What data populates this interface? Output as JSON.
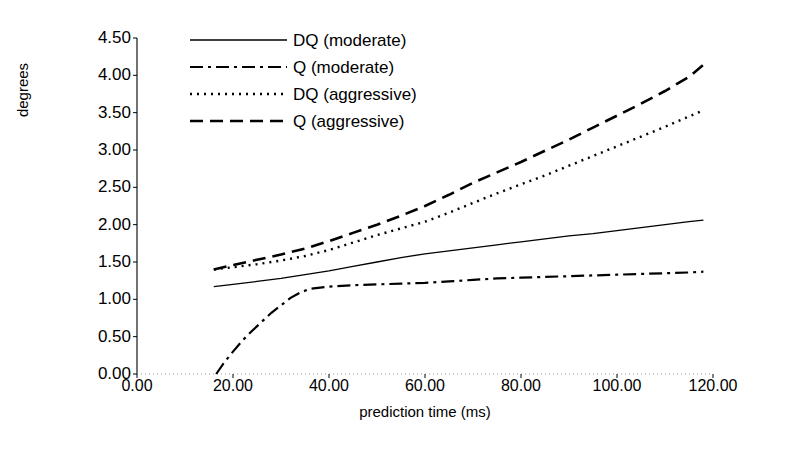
{
  "chart_data": {
    "type": "line",
    "title": "",
    "xlabel": "prediction time (ms)",
    "ylabel": "degrees",
    "xlim": [
      0,
      120
    ],
    "ylim": [
      0,
      4.5
    ],
    "xticks": [
      "0.00",
      "20.00",
      "40.00",
      "60.00",
      "80.00",
      "100.00",
      "120.00"
    ],
    "xtick_values": [
      0,
      20,
      40,
      60,
      80,
      100,
      120
    ],
    "yticks": [
      "0.00",
      "0.50",
      "1.00",
      "1.50",
      "2.00",
      "2.50",
      "3.00",
      "3.50",
      "4.00",
      "4.50"
    ],
    "ytick_values": [
      0,
      0.5,
      1,
      1.5,
      2,
      2.5,
      3,
      3.5,
      4,
      4.5
    ],
    "grid": false,
    "legend_position": "top-center",
    "series": [
      {
        "name": "DQ (moderate)",
        "style": "solid",
        "x": [
          16,
          20,
          25,
          30,
          35,
          40,
          45,
          50,
          55,
          60,
          65,
          70,
          75,
          80,
          85,
          90,
          95,
          100,
          105,
          110,
          115,
          118
        ],
        "y": [
          1.17,
          1.2,
          1.24,
          1.28,
          1.33,
          1.38,
          1.44,
          1.5,
          1.56,
          1.61,
          1.65,
          1.69,
          1.73,
          1.77,
          1.81,
          1.85,
          1.88,
          1.92,
          1.96,
          2.0,
          2.04,
          2.06
        ]
      },
      {
        "name": "Q (moderate)",
        "style": "dashdot",
        "x": [
          16.5,
          18,
          20,
          22,
          24,
          26,
          28,
          30,
          32,
          34,
          36,
          40,
          45,
          50,
          55,
          60,
          65,
          70,
          75,
          80,
          85,
          90,
          95,
          100,
          105,
          110,
          115,
          118
        ],
        "y": [
          0.0,
          0.14,
          0.3,
          0.45,
          0.58,
          0.7,
          0.82,
          0.92,
          1.02,
          1.09,
          1.14,
          1.17,
          1.19,
          1.2,
          1.21,
          1.22,
          1.24,
          1.26,
          1.28,
          1.29,
          1.3,
          1.31,
          1.32,
          1.33,
          1.34,
          1.35,
          1.36,
          1.37
        ]
      },
      {
        "name": "DQ (aggressive)",
        "style": "dotted",
        "x": [
          16,
          20,
          25,
          30,
          35,
          40,
          45,
          50,
          55,
          60,
          65,
          70,
          75,
          80,
          85,
          90,
          95,
          100,
          105,
          110,
          115,
          118
        ],
        "y": [
          1.4,
          1.43,
          1.47,
          1.52,
          1.58,
          1.66,
          1.76,
          1.86,
          1.95,
          2.04,
          2.16,
          2.29,
          2.42,
          2.54,
          2.66,
          2.79,
          2.92,
          3.05,
          3.18,
          3.31,
          3.45,
          3.53
        ]
      },
      {
        "name": "Q (aggressive)",
        "style": "dashed",
        "x": [
          16,
          20,
          25,
          30,
          35,
          40,
          45,
          50,
          55,
          60,
          65,
          70,
          75,
          80,
          85,
          90,
          95,
          100,
          105,
          110,
          115,
          118
        ],
        "y": [
          1.4,
          1.46,
          1.53,
          1.6,
          1.68,
          1.78,
          1.89,
          2.0,
          2.12,
          2.25,
          2.4,
          2.56,
          2.7,
          2.84,
          2.99,
          3.14,
          3.3,
          3.46,
          3.62,
          3.79,
          3.98,
          4.14
        ]
      }
    ]
  },
  "colors": {
    "line": "#000000",
    "axis": "#000000",
    "background": "#ffffff"
  }
}
